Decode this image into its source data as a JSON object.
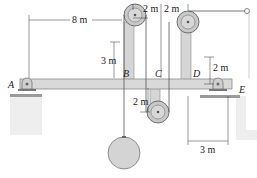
{
  "diagram": {
    "type": "pulley-beam-system",
    "dimensions": {
      "A_to_B_horizontal": "8 m",
      "B_to_C_horizontal": "2 m",
      "C_to_D_horizontal": "2 m",
      "B_pulley_height": "3 m",
      "C_pulley_depth": "2 m",
      "D_pulley_height": "2 m",
      "E_offset": "3 m"
    },
    "points": {
      "A": "A",
      "B": "B",
      "C": "C",
      "D": "D",
      "E": "E"
    },
    "colors": {
      "beam": "#d9d9d9",
      "beam_edge": "#8a8a8a",
      "pulley": "#c8c8c8",
      "pulley_edge": "#6f6f6f",
      "ground": "#e6e6e6",
      "cable": "#555555",
      "dim_line": "#333333"
    }
  }
}
